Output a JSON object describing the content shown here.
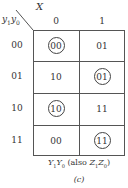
{
  "diagram": {
    "corner": {
      "col_var": "X",
      "row_var_1": "y",
      "row_var_1_sub": "1",
      "row_var_0": "y",
      "row_var_0_sub": "0"
    },
    "columns": [
      "0",
      "1"
    ],
    "rows": [
      {
        "label": "00",
        "cells": [
          {
            "value": "00",
            "circled": true
          },
          {
            "value": "01",
            "circled": false
          }
        ]
      },
      {
        "label": "01",
        "cells": [
          {
            "value": "10",
            "circled": false
          },
          {
            "value": "01",
            "circled": true
          }
        ]
      },
      {
        "label": "10",
        "cells": [
          {
            "value": "10",
            "circled": true
          },
          {
            "value": "11",
            "circled": false
          }
        ]
      },
      {
        "label": "11",
        "cells": [
          {
            "value": "00",
            "circled": false
          },
          {
            "value": "11",
            "circled": true
          }
        ]
      }
    ],
    "caption": {
      "y1": "Y",
      "y1_sub": "1",
      "y0": "Y",
      "y0_sub": "0",
      "also": "(also ",
      "z1": "Z",
      "z1_sub": "1",
      "z0": "Z",
      "z0_sub": "0",
      "close": ")"
    },
    "figure_label": "(c)"
  }
}
